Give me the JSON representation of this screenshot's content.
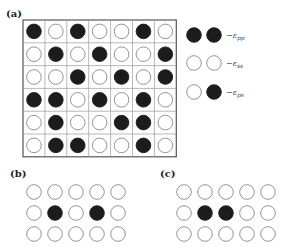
{
  "panels": {
    "a": {
      "label": "(a)",
      "grid": [
        [
          "B",
          "W",
          "B",
          "W",
          "W",
          "B",
          "W"
        ],
        [
          "W",
          "B",
          "W",
          "B",
          "W",
          "W",
          "B"
        ],
        [
          "W",
          "W",
          "B",
          "W",
          "B",
          "W",
          "B"
        ],
        [
          "B",
          "B",
          "W",
          "B",
          "W",
          "B",
          "W"
        ],
        [
          "W",
          "B",
          "W",
          "W",
          "B",
          "B",
          "W"
        ],
        [
          "W",
          "B",
          "B",
          "W",
          "W",
          "B",
          "W"
        ]
      ]
    },
    "b": {
      "label": "(b)",
      "grid": [
        [
          "W",
          "W",
          "W",
          "W",
          "W"
        ],
        [
          "W",
          "B",
          "W",
          "B",
          "W"
        ],
        [
          "W",
          "W",
          "W",
          "W",
          "W"
        ]
      ]
    },
    "c": {
      "label": "(c)",
      "grid": [
        [
          "W",
          "W",
          "W",
          "W",
          "W"
        ],
        [
          "W",
          "B",
          "B",
          "W",
          "W"
        ],
        [
          "W",
          "W",
          "W",
          "W",
          "W"
        ]
      ]
    }
  },
  "legend": [
    {
      "pair": [
        "B",
        "B"
      ],
      "label": "−ε",
      "sub": "pp"
    },
    {
      "pair": [
        "W",
        "W"
      ],
      "label": "−ε",
      "sub": "ss"
    },
    {
      "pair": [
        "W",
        "B"
      ],
      "label": "−ε",
      "sub": "ps"
    }
  ],
  "colors": {
    "filled": "#1c1c1c",
    "outline": "#888888",
    "grid": "#555555"
  }
}
